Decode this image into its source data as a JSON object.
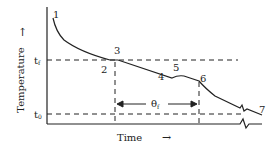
{
  "diagram": {
    "y_axis": {
      "label": "Temperature",
      "arrow": "↑"
    },
    "x_axis": {
      "label": "Time",
      "arrow": "→"
    },
    "levels": [
      {
        "label": "t",
        "sub": "f"
      },
      {
        "label": "t",
        "sub": "0"
      }
    ],
    "points": [
      "1",
      "2",
      "3",
      "4",
      "5",
      "6",
      "7"
    ],
    "interval": {
      "label": "θ",
      "sub": "f"
    },
    "colors": {
      "line": "#222222",
      "background": "#ffffff"
    }
  }
}
